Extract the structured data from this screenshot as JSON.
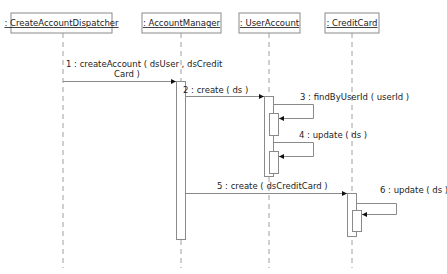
{
  "diagram": {
    "type": "sequence",
    "objects": [
      {
        "id": "dispatcher",
        "label": ": CreateAccountDispatcher",
        "x": 63
      },
      {
        "id": "manager",
        "label": ": AccountManager",
        "x": 181
      },
      {
        "id": "user",
        "label": ": UserAccount",
        "x": 269
      },
      {
        "id": "card",
        "label": ": CreditCard",
        "x": 352
      }
    ],
    "messages": [
      {
        "seq": "1",
        "from": "dispatcher",
        "to": "manager",
        "label_line1": "1 : createAccount ( dsUser , dsCredit",
        "label_line2": "Card )"
      },
      {
        "seq": "2",
        "from": "manager",
        "to": "user",
        "label": "2 : create ( ds )"
      },
      {
        "seq": "3",
        "from": "user",
        "to": "user",
        "label": "3 : findByUserId ( userId )"
      },
      {
        "seq": "4",
        "from": "user",
        "to": "user",
        "label": "4 : update ( ds )"
      },
      {
        "seq": "5",
        "from": "manager",
        "to": "card",
        "label": "5 : create ( dsCreditCard )"
      },
      {
        "seq": "6",
        "from": "card",
        "to": "card",
        "label": "6 : update ( ds )"
      }
    ],
    "colors": {
      "line": "#8a8a8a",
      "lifeline": "#a0a0a0",
      "text": "#222222",
      "background": "#ffffff"
    }
  }
}
